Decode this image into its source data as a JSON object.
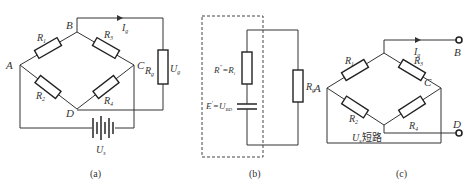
{
  "figure": {
    "panels": [
      {
        "id": "a",
        "caption": "(a)",
        "nodes": {
          "A": "A",
          "B": "B",
          "C": "C",
          "D": "D"
        },
        "resistors": {
          "r1": "R",
          "r1_sub": "1",
          "r2": "R",
          "r2_sub": "2",
          "r3": "R",
          "r3_sub": "3",
          "r4": "R",
          "r4_sub": "4",
          "rg": "R",
          "rg_sub": "g"
        },
        "current": {
          "label": "I",
          "sub": "g"
        },
        "voltage_g": {
          "label": "U",
          "sub": "g"
        },
        "source": {
          "label": "U",
          "sub": "s"
        }
      },
      {
        "id": "b",
        "caption": "(b)",
        "r_equiv": {
          "label": "R",
          "sup": "′′",
          "rhs": "=R",
          "rhs_sub": "i"
        },
        "e_equiv": {
          "label": "E",
          "sup": "′",
          "rhs": "=U",
          "rhs_sub": "BD"
        },
        "rg": {
          "label": "R",
          "sub": "g"
        }
      },
      {
        "id": "c",
        "caption": "(c)",
        "nodes": {
          "A": "A",
          "B": "B",
          "C": "C",
          "D": "D"
        },
        "resistors": {
          "r1": "R",
          "r1_sub": "1",
          "r2": "R",
          "r2_sub": "2",
          "r3": "R",
          "r3_sub": "3",
          "r4": "R",
          "r4_sub": "4"
        },
        "current": {
          "label": "I",
          "sub": "g"
        },
        "short_label": {
          "label": "U",
          "sub": "s",
          "text": "短路"
        }
      }
    ]
  },
  "colors": {
    "line": "#333333",
    "background": "#ffffff"
  }
}
